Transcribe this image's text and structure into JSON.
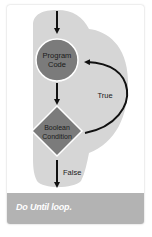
{
  "figure": {
    "type": "flowchart",
    "title": "Do Until loop",
    "caption": "Do Until loop.",
    "nodes": [
      {
        "id": "program-code",
        "shape": "circle",
        "line1": "Program",
        "line2": "Code",
        "fill": "#7b7b7b"
      },
      {
        "id": "boolean-condition",
        "shape": "diamond",
        "line1": "Boolean",
        "line2": "Condition",
        "fill": "#7b7b7b"
      }
    ],
    "edges": [
      {
        "from": "start",
        "to": "program-code",
        "label": ""
      },
      {
        "from": "program-code",
        "to": "boolean-condition",
        "label": ""
      },
      {
        "from": "boolean-condition",
        "to": "program-code",
        "label": "True"
      },
      {
        "from": "boolean-condition",
        "to": "end",
        "label": "False"
      }
    ],
    "labels": {
      "true": "True",
      "false": "False"
    },
    "colors": {
      "background_blob": "#d6d6d6",
      "node_fill": "#7b7b7b",
      "node_outline": "#ffffff",
      "arrow": "#111111",
      "caption_band": "#b3b3b3",
      "caption_text": "#ffffff"
    }
  }
}
